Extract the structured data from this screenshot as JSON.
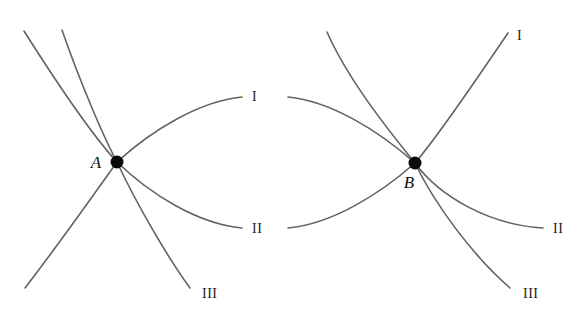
{
  "figure": {
    "background_color": "#ffffff",
    "stroke_color": "#636363",
    "dot_color": "#0a0a0a",
    "label_color": "#222222",
    "width": 585,
    "height": 313,
    "vertices": [
      {
        "id": "A",
        "label": "A",
        "x": 117,
        "y": 162,
        "label_x": 96,
        "label_y": 168,
        "radius": 6.5
      },
      {
        "id": "B",
        "label": "B",
        "x": 415,
        "y": 163,
        "label_x": 409,
        "label_y": 188,
        "radius": 6.5
      }
    ],
    "branch_labels": [
      {
        "id": "left-I",
        "text": "I",
        "x": 252,
        "y": 101
      },
      {
        "id": "left-II",
        "text": "II",
        "x": 252,
        "y": 233
      },
      {
        "id": "left-III",
        "text": "III",
        "x": 202,
        "y": 298
      },
      {
        "id": "right-I",
        "text": "I",
        "x": 517,
        "y": 40
      },
      {
        "id": "right-II",
        "text": "II",
        "x": 553,
        "y": 233
      },
      {
        "id": "right-III",
        "text": "III",
        "x": 523,
        "y": 298
      }
    ],
    "curves": [
      {
        "id": "left-upper-outer",
        "d": "M 24,31 C 55,80 92,135 117,162"
      },
      {
        "id": "left-upper-inner",
        "d": "M 62,30 C 80,82 104,138 117,162"
      },
      {
        "id": "left-lower-outer",
        "d": "M 117,162 C 90,200 52,253 25,288"
      },
      {
        "id": "left-branch-III",
        "d": "M 117,162 C 136,203 168,258 190,288"
      },
      {
        "id": "left-branch-I",
        "d": "M 117,162 C 152,130 200,101 242,97"
      },
      {
        "id": "left-branch-II",
        "d": "M 117,162 C 150,194 198,224 242,228"
      },
      {
        "id": "right-upper-outer",
        "d": "M 288,97 C 330,101 378,130 415,163"
      },
      {
        "id": "right-lower-outer",
        "d": "M 288,228 C 332,224 380,194 415,163"
      },
      {
        "id": "right-incoming",
        "d": "M 327,32 C 350,84 395,138 415,163"
      },
      {
        "id": "right-branch-I",
        "d": "M 415,163 C 440,134 480,74 508,33"
      },
      {
        "id": "right-branch-II",
        "d": "M 415,163 C 440,197 490,225 543,228"
      },
      {
        "id": "right-branch-III",
        "d": "M 415,163 C 434,203 472,255 510,288"
      }
    ]
  }
}
